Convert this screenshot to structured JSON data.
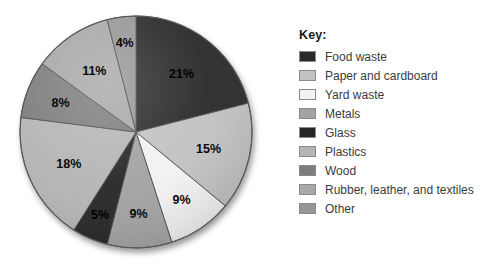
{
  "legend": {
    "title": "Key:",
    "items": [
      {
        "label": "Food waste",
        "color": "#2a2a2a"
      },
      {
        "label": "Paper and cardboard",
        "color": "#c2c2c2"
      },
      {
        "label": "Yard waste",
        "color": "#f2f2f2"
      },
      {
        "label": "Metals",
        "color": "#a3a3a3"
      },
      {
        "label": "Glass",
        "color": "#262626"
      },
      {
        "label": "Plastics",
        "color": "#b5b5b5"
      },
      {
        "label": "Wood",
        "color": "#7d7d7d"
      },
      {
        "label": "Rubber, leather, and textiles",
        "color": "#a8a8a8"
      },
      {
        "label": "Other",
        "color": "#969696"
      }
    ]
  },
  "chart_data": {
    "type": "pie",
    "title": "",
    "xlabel": "",
    "ylabel": "",
    "legend_position": "right",
    "grid": false,
    "start_angle_deg": 0,
    "direction": "clockwise",
    "categories": [
      "Food waste",
      "Paper and cardboard",
      "Yard waste",
      "Metals",
      "Glass",
      "Plastics",
      "Wood",
      "Rubber, leather, and textiles",
      "Other"
    ],
    "values": [
      21,
      15,
      9,
      9,
      5,
      18,
      8,
      11,
      4
    ],
    "labels": [
      "21%",
      "15%",
      "9%",
      "9%",
      "5%",
      "18%",
      "8%",
      "11%",
      "4%"
    ],
    "colors": [
      "#2a2a2a",
      "#c2c2c2",
      "#f2f2f2",
      "#a3a3a3",
      "#262626",
      "#b5b5b5",
      "#7d7d7d",
      "#a8a8a8",
      "#969696"
    ],
    "units": "percent",
    "total": 100
  },
  "geometry": {
    "cx": 128,
    "cy": 126,
    "r": 116,
    "label_r_factor": 0.64
  }
}
